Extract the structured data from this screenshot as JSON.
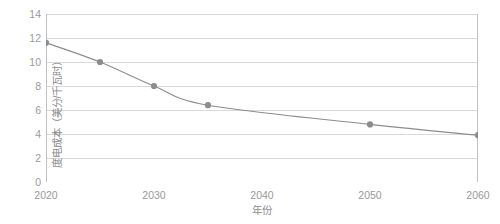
{
  "chart_data": {
    "type": "line",
    "title": "",
    "subtitle": "",
    "xlabel": "年份",
    "ylabel": "度电成本（美分/千瓦时）",
    "x": [
      2020,
      2025,
      2030,
      2035,
      2050,
      2060
    ],
    "values": [
      11.6,
      10.0,
      8.0,
      6.4,
      4.8,
      3.9
    ],
    "series": [
      {
        "name": "度电成本",
        "x": [
          2020,
          2025,
          2030,
          2035,
          2050,
          2060
        ],
        "values": [
          11.6,
          10.0,
          8.0,
          6.4,
          4.8,
          3.9
        ]
      }
    ],
    "xlim": [
      2020,
      2060
    ],
    "ylim": [
      0,
      14
    ],
    "xticks": [
      2020,
      2030,
      2040,
      2050,
      2060
    ],
    "xtick_labels": [
      "2020",
      "2030",
      "2040",
      "2050",
      "2060"
    ],
    "yticks": [
      0,
      2,
      4,
      6,
      8,
      10,
      12,
      14
    ],
    "ytick_labels": [
      "0",
      "2",
      "4",
      "6",
      "8",
      "10",
      "12",
      "14"
    ],
    "grid": "horizontal",
    "legend": "none",
    "line_color": "#8c8c8c",
    "marker_color": "#8c8c8c",
    "grid_color": "#d9d9d9",
    "axis_color": "#bfbfbf",
    "tick_label_color": "#9a9a9a",
    "axis_title_color": "#8c8c8c",
    "background_color": "#ffffff"
  }
}
